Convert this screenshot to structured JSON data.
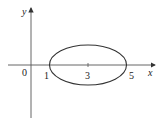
{
  "diagram": {
    "axes": {
      "x_label": "x",
      "y_label": "y",
      "origin_label": "0"
    },
    "ellipse": {
      "center_x": 3,
      "left_x": 1,
      "right_x": 5,
      "semi_major": 2,
      "semi_minor_ratio": 0.52
    },
    "tick_labels": [
      "1",
      "3",
      "5"
    ],
    "colors": {
      "stroke": "#333333",
      "text": "#222222"
    }
  }
}
